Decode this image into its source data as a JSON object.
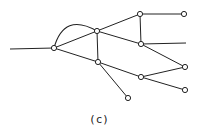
{
  "figure": {
    "caption": "(c)",
    "stroke_color": "#222222",
    "node_fill": "#ffffff",
    "nodes": [
      {
        "id": "A",
        "x": 54,
        "y": 48
      },
      {
        "id": "B",
        "x": 97,
        "y": 31
      },
      {
        "id": "C",
        "x": 98,
        "y": 62
      },
      {
        "id": "D",
        "x": 140,
        "y": 14
      },
      {
        "id": "E",
        "x": 184,
        "y": 14
      },
      {
        "id": "F",
        "x": 141,
        "y": 44
      },
      {
        "id": "G",
        "x": 185,
        "y": 67
      },
      {
        "id": "H",
        "x": 141,
        "y": 77
      },
      {
        "id": "I",
        "x": 185,
        "y": 90
      },
      {
        "id": "J",
        "x": 128,
        "y": 98
      }
    ],
    "edges": [
      [
        "A",
        "B"
      ],
      [
        "A",
        "C"
      ],
      [
        "B",
        "C"
      ],
      [
        "B",
        "D"
      ],
      [
        "B",
        "F"
      ],
      [
        "D",
        "E"
      ],
      [
        "D",
        "F"
      ],
      [
        "F",
        "G"
      ],
      [
        "C",
        "H"
      ],
      [
        "H",
        "G"
      ],
      [
        "H",
        "I"
      ],
      [
        "C",
        "J"
      ]
    ],
    "open_lines": [
      {
        "from": "A",
        "to_x": 10,
        "to_y": 49
      },
      {
        "from": "F",
        "to_x": 186,
        "to_y": 43
      }
    ],
    "arcs": [
      {
        "from": "A",
        "to": "B",
        "ctrl_x": 64,
        "ctrl_y": 12
      }
    ]
  }
}
